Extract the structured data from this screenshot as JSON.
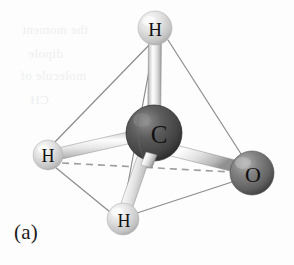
{
  "figure": {
    "caption": "(a)",
    "background_color": "#fdfdfd"
  },
  "molecule": {
    "type": "ball-and-stick",
    "geometry": "tetrahedral",
    "central_atom": {
      "label": "C",
      "name": "carbon",
      "cx": 154,
      "cy": 133,
      "r": 28,
      "color": "#4a4a4a",
      "highlight_color": "#8d8d8d",
      "shadow_color": "#2a2a2a",
      "label_color": "#111111",
      "label_size": 25
    },
    "outer_atoms": [
      {
        "label": "H",
        "name": "hydrogen-top",
        "cx": 155,
        "cy": 28,
        "r": 17,
        "color": "#d6d6d6",
        "highlight_color": "#f4f4f4",
        "shadow_color": "#a8a8a8",
        "label_color": "#111111",
        "label_size": 19
      },
      {
        "label": "H",
        "name": "hydrogen-left",
        "cx": 48,
        "cy": 155,
        "r": 15,
        "color": "#d4d4d4",
        "highlight_color": "#f2f2f2",
        "shadow_color": "#a6a6a6",
        "label_color": "#111111",
        "label_size": 18
      },
      {
        "label": "H",
        "name": "hydrogen-bottom",
        "cx": 123,
        "cy": 219,
        "r": 16,
        "color": "#d2d2d2",
        "highlight_color": "#f1f1f1",
        "shadow_color": "#a4a4a4",
        "label_color": "#111111",
        "label_size": 18
      },
      {
        "label": "O",
        "name": "oxygen-right",
        "cx": 252,
        "cy": 173,
        "r": 22,
        "color": "#6b6b6b",
        "highlight_color": "#a9a9a9",
        "shadow_color": "#3d3d3d",
        "label_color": "#111111",
        "label_size": 22
      }
    ],
    "bonds": [
      {
        "name": "bond-c-h-top",
        "from": "C",
        "to": "H",
        "width": 11,
        "color": "#dcdcdc",
        "highlight": "#fbfbfb",
        "edge": "#9a9a9a"
      },
      {
        "name": "bond-c-h-left",
        "from": "C",
        "to": "H",
        "width": 11,
        "color": "#dcdcdc",
        "highlight": "#fbfbfb",
        "edge": "#9a9a9a"
      },
      {
        "name": "bond-c-h-bottom",
        "from": "C",
        "to": "H",
        "width": 11,
        "color": "#dcdcdc",
        "highlight": "#fbfbfb",
        "edge": "#9a9a9a"
      },
      {
        "name": "bond-c-o",
        "from": "C",
        "to": "O",
        "width": 12,
        "color": "#d7d7d7",
        "highlight": "#fafafa",
        "edge": "#949494"
      }
    ],
    "wireframe": {
      "name": "tetrahedron-edges",
      "color": "#8c8c8c",
      "width": 1.2,
      "edges": [
        [
          "hydrogen-top",
          "hydrogen-left"
        ],
        [
          "hydrogen-top",
          "hydrogen-bottom"
        ],
        [
          "hydrogen-top",
          "oxygen-right"
        ],
        [
          "hydrogen-left",
          "hydrogen-bottom"
        ],
        [
          "hydrogen-bottom",
          "oxygen-right"
        ]
      ]
    },
    "hidden_edge": {
      "name": "dashed-rear-edge",
      "from": "hydrogen-left",
      "to": "oxygen-right",
      "color": "#9d9d9d",
      "width": 1.6,
      "dash": "7 5"
    }
  },
  "background_bleed": [
    {
      "text": "the moment",
      "x": 22,
      "y": 22
    },
    {
      "text": "dipole",
      "x": 28,
      "y": 46
    },
    {
      "text": "molecule of",
      "x": 20,
      "y": 68
    },
    {
      "text": "CH",
      "x": 30,
      "y": 92
    }
  ]
}
